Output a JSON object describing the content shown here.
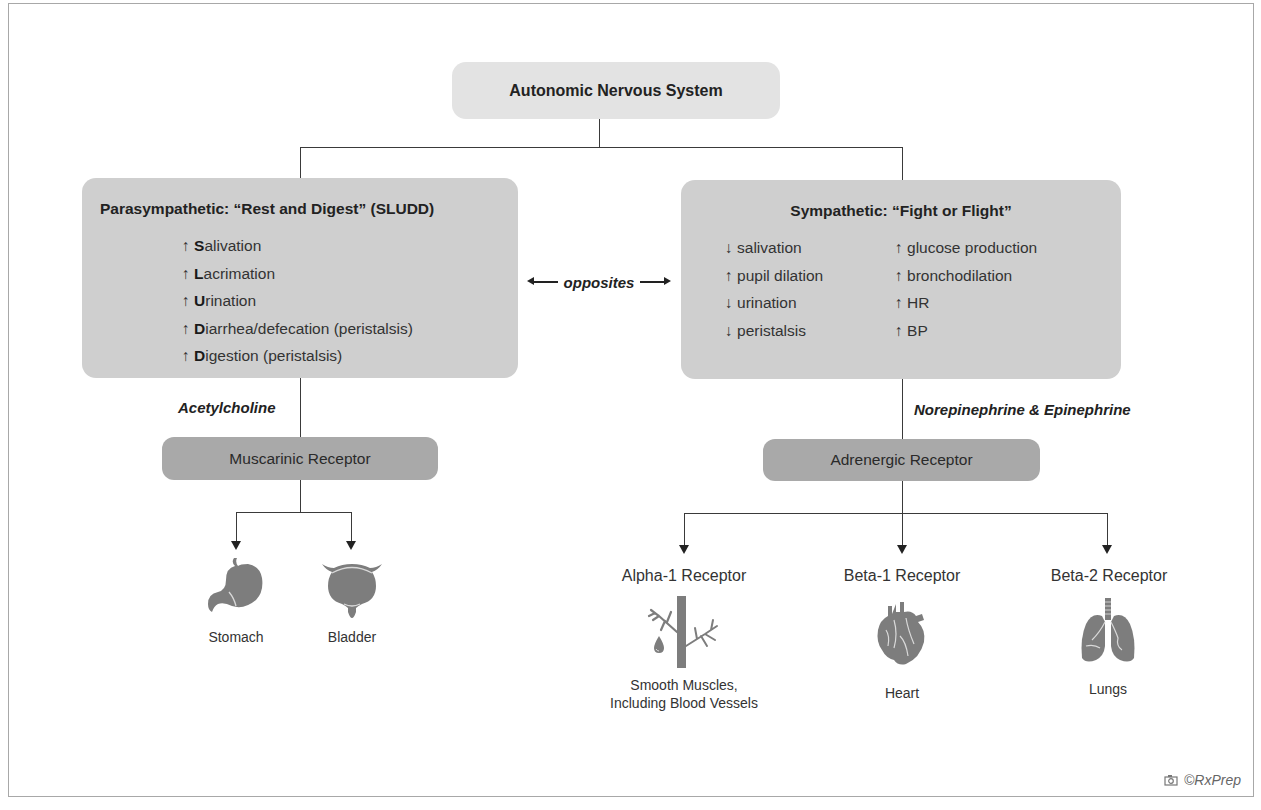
{
  "diagram": {
    "title": "Autonomic Nervous System",
    "parasympathetic": {
      "heading": "Parasympathetic: “Rest and Digest” (SLUDD)",
      "items": [
        {
          "arrow": "↑",
          "initial": "S",
          "rest": "alivation"
        },
        {
          "arrow": "↑",
          "initial": "L",
          "rest": "acrimation"
        },
        {
          "arrow": "↑",
          "initial": "U",
          "rest": "rination"
        },
        {
          "arrow": "↑",
          "initial": "D",
          "rest": "iarrhea/defecation (peristalsis)"
        },
        {
          "arrow": "↑",
          "initial": "D",
          "rest": "igestion (peristalsis)"
        }
      ],
      "neurotransmitter": "Acetylcholine",
      "receptor": "Muscarinic Receptor",
      "targets": [
        {
          "label": "Stomach",
          "icon": "stomach-icon"
        },
        {
          "label": "Bladder",
          "icon": "bladder-icon"
        }
      ]
    },
    "relation_label": "opposites",
    "sympathetic": {
      "heading": "Sympathetic: “Fight or Flight”",
      "left_items": [
        "↓ salivation",
        "↑ pupil dilation",
        "↓ urination",
        "↓ peristalsis"
      ],
      "right_items": [
        "↑ glucose production",
        "↑ bronchodilation",
        "↑ HR",
        "↑ BP"
      ],
      "neurotransmitter": "Norepinephrine & Epinephrine",
      "receptor": "Adrenergic Receptor",
      "subreceptors": [
        {
          "name": "Alpha-1 Receptor",
          "target_line1": "Smooth Muscles,",
          "target_line2": "Including Blood Vessels",
          "icon": "blood-vessel-icon"
        },
        {
          "name": "Beta-1 Receptor",
          "target_line1": "Heart",
          "target_line2": "",
          "icon": "heart-icon"
        },
        {
          "name": "Beta-2 Receptor",
          "target_line1": "Lungs",
          "target_line2": "",
          "icon": "lungs-icon"
        }
      ]
    },
    "credit": "©RxPrep",
    "colors": {
      "title_box": "#e3e3e3",
      "category_box": "#cfcfcf",
      "receptor_box": "#a9a9a9",
      "icon_gray": "#7d7d7d",
      "line": "#3a3a3a"
    }
  }
}
